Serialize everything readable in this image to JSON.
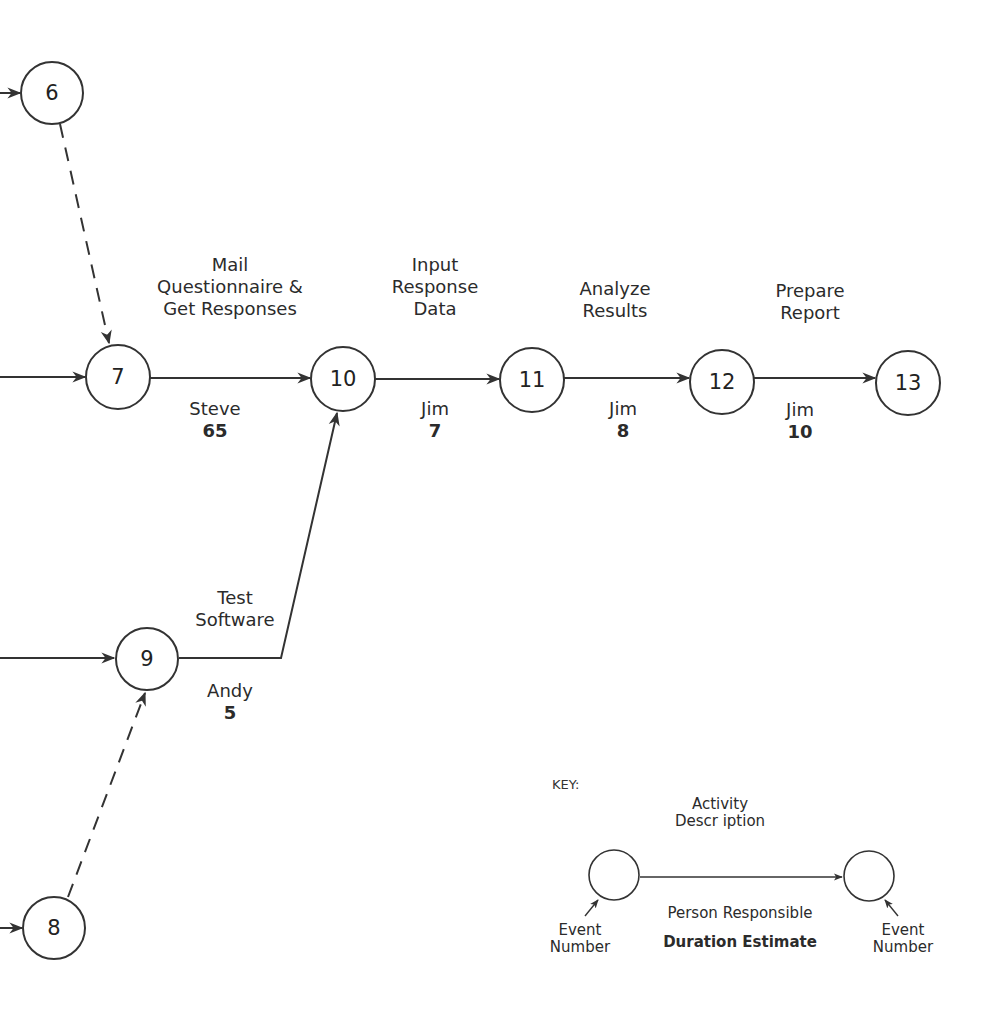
{
  "nodes": [
    {
      "id": "6",
      "label": "6",
      "cx": 52,
      "cy": 93
    },
    {
      "id": "7",
      "label": "7",
      "cx": 118,
      "cy": 377
    },
    {
      "id": "10",
      "label": "10",
      "cx": 343,
      "cy": 379
    },
    {
      "id": "11",
      "label": "11",
      "cx": 532,
      "cy": 380
    },
    {
      "id": "12",
      "label": "12",
      "cx": 722,
      "cy": 382
    },
    {
      "id": "13",
      "label": "13",
      "cx": 908,
      "cy": 383
    },
    {
      "id": "9",
      "label": "9",
      "cx": 147,
      "cy": 659
    },
    {
      "id": "8",
      "label": "8",
      "cx": 54,
      "cy": 928
    }
  ],
  "activities": {
    "mail": {
      "desc": [
        "Mail",
        "Questionnaire  &",
        "Get Responses"
      ],
      "person": "Steve",
      "duration": "65"
    },
    "input": {
      "desc": [
        "Input",
        "Response",
        "Data"
      ],
      "person": "Jim",
      "duration": "7"
    },
    "analyze": {
      "desc": [
        "Analyze",
        "Results"
      ],
      "person": "Jim",
      "duration": "8"
    },
    "prepare": {
      "desc": [
        "Prepare",
        "Report"
      ],
      "person": "Jim",
      "duration": "10"
    },
    "test": {
      "desc": [
        "Test",
        "Software"
      ],
      "person": "Andy",
      "duration": "5"
    }
  },
  "key": {
    "title": "KEY:",
    "activity_description": [
      "Activity",
      "Descr iption"
    ],
    "person_responsible": "Person Responsible",
    "duration_estimate": "Duration Estimate",
    "event_number_left": [
      "Event",
      "Number"
    ],
    "event_number_right": [
      "Event",
      "Number"
    ]
  },
  "colors": {
    "line": "#333333",
    "text": "#2b2b2b",
    "background": "#ffffff"
  }
}
